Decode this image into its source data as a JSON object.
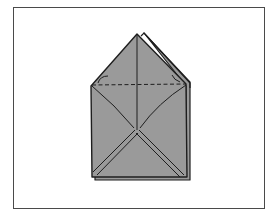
{
  "diagram": {
    "type": "origami-fold-step",
    "colors": {
      "paper": "#9a9a9a",
      "line": "#1e1e1e",
      "frame": "#4a4a4a",
      "background": "#ffffff"
    },
    "fold_line": "dashed",
    "arrows": [
      "left-fold-arrow",
      "right-fold-arrow"
    ]
  }
}
